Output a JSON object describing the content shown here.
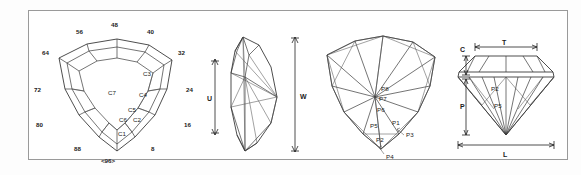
{
  "diagram": {
    "border_color": "#9a9a9a",
    "line_color": "#3a3a3a",
    "background": "#ffffff",
    "views": [
      {
        "id": "crown-view",
        "name": "Crown view",
        "index_labels": {
          "top_center": "48",
          "top_left": "56",
          "top_right": "40",
          "left_upper": "64",
          "right_upper": "32",
          "left_mid": "72",
          "right_mid": "24",
          "left_lower": "80",
          "right_lower": "16",
          "bottom_left": "88",
          "bottom_right": "8",
          "bottom_center": "<96>"
        },
        "facets": [
          "C7",
          "C3",
          "C4",
          "C5",
          "C6",
          "C2",
          "C1"
        ]
      },
      {
        "id": "profile-view-left",
        "name": "Side profile view",
        "dimensions": [
          "U",
          "W"
        ]
      },
      {
        "id": "pavilion-view",
        "name": "Pavilion view",
        "facets": [
          "P8",
          "P7",
          "P6",
          "P5",
          "P1",
          "P2",
          "P3",
          "P4"
        ]
      },
      {
        "id": "profile-view-right",
        "name": "Cut profile view",
        "dimensions": [
          "C",
          "T",
          "P",
          "L"
        ],
        "facets": [
          "P2",
          "P5"
        ]
      }
    ]
  }
}
